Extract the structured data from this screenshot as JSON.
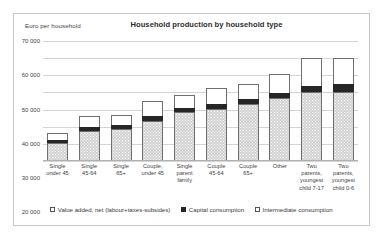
{
  "axis_unit_label": "Euro per household",
  "legend": {
    "items": [
      {
        "label": "Value added, net (labour+taxes-subsides)",
        "swatch": "value-added"
      },
      {
        "label": "Capital consumption",
        "swatch": "capital"
      },
      {
        "label": "Intermediate consumption",
        "swatch": "intermediate"
      }
    ]
  },
  "chart_data": {
    "type": "bar",
    "stacked": true,
    "title": "Household production by household type",
    "xlabel": "",
    "ylabel": "Euro per household",
    "ylim": [
      0,
      70000
    ],
    "yticks": [
      "0",
      "10 000",
      "20 000",
      "30 000",
      "40 000",
      "50 000",
      "60 000",
      "70 000"
    ],
    "ytick_values": [
      0,
      10000,
      20000,
      30000,
      40000,
      50000,
      60000,
      70000
    ],
    "grid": true,
    "legend_position": "bottom",
    "categories": [
      "Single under 45",
      "Single 45-64",
      "Single 65+",
      "Couple, under 45",
      "Single parent family",
      "Couple 45-64",
      "Couple 65+",
      "Other",
      "Two parents, youngest child 7-17",
      "Two parents, youngest child 0-6"
    ],
    "category_lines": [
      [
        "Single",
        "under 45"
      ],
      [
        "Single",
        "45-64"
      ],
      [
        "Single",
        "65+"
      ],
      [
        "Couple,",
        "under 45"
      ],
      [
        "Single",
        "parent",
        "family"
      ],
      [
        "Couple",
        "45-64"
      ],
      [
        "Couple",
        "65+"
      ],
      [
        "Other"
      ],
      [
        "Two",
        "parents,",
        "youngest",
        "child  7-17"
      ],
      [
        "Two",
        "parents,",
        "youngest",
        "child 0-6"
      ]
    ],
    "series": [
      {
        "name": "Value added, net (labour+taxes-subsides)",
        "values": [
          10500,
          17500,
          18500,
          23500,
          28500,
          30500,
          33000,
          36500,
          40000,
          40500
        ]
      },
      {
        "name": "Capital consumption",
        "values": [
          2000,
          2500,
          2500,
          3000,
          2500,
          3000,
          3000,
          3000,
          4000,
          4500
        ]
      },
      {
        "name": "Intermediate consumption",
        "values": [
          4000,
          6000,
          6000,
          8500,
          7500,
          9000,
          9000,
          11000,
          16000,
          15000
        ]
      }
    ],
    "totals": [
      16500,
      26000,
      27000,
      35000,
      38500,
      42500,
      45000,
      50500,
      60000,
      60000
    ]
  }
}
